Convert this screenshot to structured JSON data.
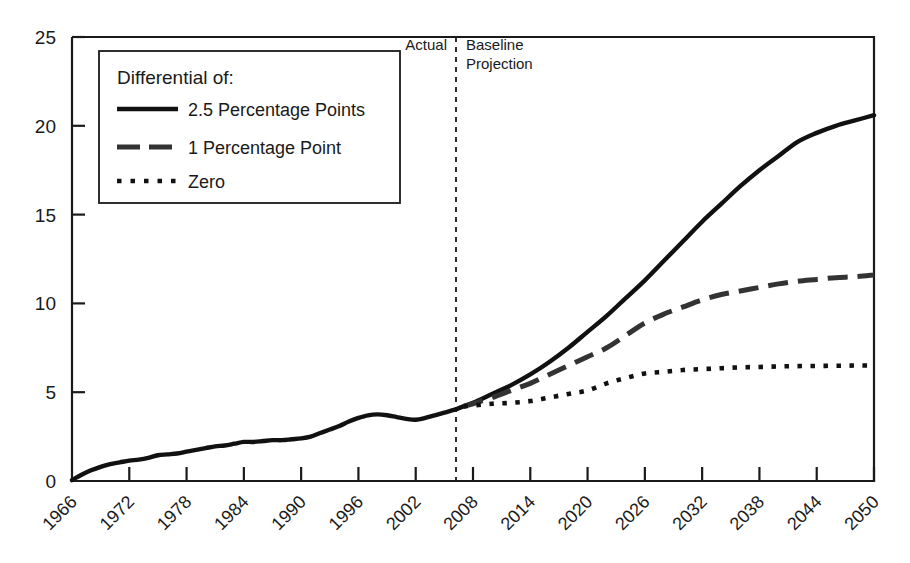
{
  "chart_data": {
    "type": "line",
    "title": "",
    "xlabel": "",
    "ylabel": "",
    "xlim": [
      1966,
      2050
    ],
    "ylim": [
      0,
      25
    ],
    "grid": false,
    "legend_position": "top-left",
    "x_ticks": [
      1966,
      1972,
      1978,
      1984,
      1990,
      1996,
      2002,
      2008,
      2014,
      2020,
      2026,
      2032,
      2038,
      2044,
      2050
    ],
    "y_ticks": [
      0,
      5,
      10,
      15,
      20,
      25
    ],
    "annotations": [
      {
        "name": "actual-label",
        "text": "Actual",
        "x": 2005
      },
      {
        "name": "projection-label-line1",
        "text": "Baseline",
        "x": 2009
      },
      {
        "name": "projection-label-line2",
        "text": "Projection",
        "x": 2009
      },
      {
        "name": "divider",
        "text": "",
        "x": 2007,
        "style": "dashed-vertical"
      }
    ],
    "divider_year": 2007,
    "series": [
      {
        "name": "2.5 Percentage Points",
        "style": "solid",
        "color": "#111111",
        "x": [
          1966,
          1967,
          1968,
          1969,
          1970,
          1971,
          1972,
          1973,
          1974,
          1975,
          1976,
          1977,
          1978,
          1979,
          1980,
          1981,
          1982,
          1983,
          1984,
          1985,
          1986,
          1987,
          1988,
          1989,
          1990,
          1991,
          1992,
          1993,
          1994,
          1995,
          1996,
          1997,
          1998,
          1999,
          2000,
          2001,
          2002,
          2003,
          2004,
          2005,
          2006,
          2007,
          2008,
          2010,
          2012,
          2014,
          2016,
          2018,
          2020,
          2022,
          2024,
          2026,
          2028,
          2030,
          2032,
          2034,
          2036,
          2038,
          2040,
          2042,
          2044,
          2046,
          2048,
          2050
        ],
        "values": [
          0.05,
          0.35,
          0.6,
          0.8,
          0.95,
          1.05,
          1.15,
          1.2,
          1.3,
          1.45,
          1.5,
          1.55,
          1.65,
          1.75,
          1.85,
          1.95,
          2.0,
          2.1,
          2.2,
          2.2,
          2.25,
          2.3,
          2.3,
          2.35,
          2.4,
          2.5,
          2.7,
          2.9,
          3.1,
          3.35,
          3.55,
          3.7,
          3.75,
          3.7,
          3.6,
          3.5,
          3.45,
          3.55,
          3.7,
          3.85,
          4.0,
          4.2,
          4.4,
          4.9,
          5.4,
          6.0,
          6.7,
          7.5,
          8.4,
          9.3,
          10.3,
          11.3,
          12.4,
          13.5,
          14.6,
          15.6,
          16.6,
          17.5,
          18.3,
          19.1,
          19.6,
          20.0,
          20.3,
          20.6
        ]
      },
      {
        "name": "1 Percentage Point",
        "style": "dashed",
        "color": "#333333",
        "x": [
          2007,
          2008,
          2010,
          2012,
          2014,
          2016,
          2018,
          2020,
          2022,
          2024,
          2026,
          2028,
          2030,
          2032,
          2034,
          2036,
          2038,
          2040,
          2042,
          2044,
          2046,
          2048,
          2050
        ],
        "values": [
          4.2,
          4.35,
          4.7,
          5.1,
          5.5,
          6.0,
          6.5,
          7.0,
          7.5,
          8.2,
          8.9,
          9.4,
          9.8,
          10.2,
          10.5,
          10.7,
          10.9,
          11.1,
          11.25,
          11.35,
          11.45,
          11.5,
          11.6
        ]
      },
      {
        "name": "Zero",
        "style": "dotted",
        "color": "#111111",
        "x": [
          2007,
          2008,
          2010,
          2012,
          2014,
          2016,
          2018,
          2020,
          2022,
          2024,
          2026,
          2028,
          2030,
          2032,
          2034,
          2036,
          2038,
          2040,
          2042,
          2044,
          2046,
          2048,
          2050
        ],
        "values": [
          4.2,
          4.25,
          4.35,
          4.4,
          4.5,
          4.7,
          4.9,
          5.1,
          5.5,
          5.8,
          6.05,
          6.15,
          6.25,
          6.3,
          6.35,
          6.4,
          6.42,
          6.45,
          6.47,
          6.48,
          6.49,
          6.5,
          6.5
        ]
      }
    ]
  },
  "legend": {
    "title": "Differential of:",
    "items": [
      {
        "label": "2.5 Percentage Points",
        "style": "solid"
      },
      {
        "label": "1 Percentage Point",
        "style": "dashed"
      },
      {
        "label": "Zero",
        "style": "dotted"
      }
    ]
  },
  "axis": {
    "y_labels": [
      "25",
      "20",
      "15",
      "10",
      "5",
      "0"
    ],
    "x_labels": [
      "1966",
      "1972",
      "1978",
      "1984",
      "1990",
      "1996",
      "2002",
      "2008",
      "2014",
      "2020",
      "2026",
      "2032",
      "2038",
      "2044",
      "2050"
    ]
  },
  "colors": {
    "axis": "#1a1a1a",
    "solid_series": "#111111",
    "dashed_series": "#333333",
    "dotted_series": "#111111",
    "background": "#ffffff"
  }
}
